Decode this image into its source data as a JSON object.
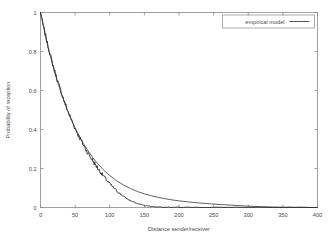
{
  "chart_data": {
    "type": "line",
    "title": "",
    "xlabel": "Distance sender/receiver",
    "ylabel": "Probability of reception",
    "xlim": [
      0,
      400
    ],
    "ylim": [
      0,
      1
    ],
    "grid": false,
    "legend_position": "top-right",
    "xticks": [
      0,
      50,
      100,
      150,
      200,
      250,
      300,
      350,
      400
    ],
    "xtick_labels": [
      "0",
      "50",
      "100",
      "150",
      "200",
      "250",
      "300",
      "350",
      "400"
    ],
    "yticks": [
      0,
      0.2,
      0.4,
      0.6,
      0.8,
      1
    ],
    "ytick_labels": [
      "0",
      "0.2",
      "0.4",
      "0.6",
      "0.8",
      "1"
    ],
    "series": [
      {
        "name": "empirical model",
        "style": "smooth-line",
        "color": "#444444",
        "x": [
          0,
          5,
          10,
          15,
          20,
          25,
          30,
          35,
          40,
          45,
          50,
          55,
          60,
          65,
          70,
          75,
          80,
          85,
          90,
          95,
          100,
          110,
          120,
          130,
          140,
          150,
          160,
          170,
          180,
          190,
          200,
          215,
          230,
          245,
          260,
          275,
          290,
          300,
          320,
          340,
          360,
          380,
          400
        ],
        "values": [
          1.0,
          0.915,
          0.837,
          0.766,
          0.7,
          0.64,
          0.585,
          0.535,
          0.488,
          0.446,
          0.407,
          0.372,
          0.34,
          0.31,
          0.283,
          0.258,
          0.236,
          0.215,
          0.196,
          0.179,
          0.164,
          0.137,
          0.115,
          0.097,
          0.082,
          0.07,
          0.06,
          0.052,
          0.045,
          0.039,
          0.034,
          0.028,
          0.023,
          0.019,
          0.015,
          0.012,
          0.009,
          0.007,
          0.004,
          0.002,
          0.001,
          0.0005,
          0.0
        ]
      },
      {
        "name": "measured data",
        "style": "noisy-line",
        "color": "#2e2e2e",
        "x": [
          0,
          5,
          10,
          15,
          20,
          25,
          30,
          35,
          40,
          45,
          50,
          55,
          60,
          65,
          70,
          75,
          80,
          85,
          90,
          95,
          100,
          105,
          110,
          115,
          120,
          125,
          130,
          135,
          140,
          145,
          150,
          155,
          160,
          165,
          170,
          180,
          190,
          200,
          220,
          240,
          260,
          280,
          300,
          330,
          360,
          400
        ],
        "values": [
          1.0,
          0.918,
          0.84,
          0.77,
          0.705,
          0.645,
          0.59,
          0.538,
          0.49,
          0.447,
          0.405,
          0.368,
          0.334,
          0.3,
          0.27,
          0.243,
          0.216,
          0.19,
          0.166,
          0.143,
          0.122,
          0.103,
          0.086,
          0.07,
          0.057,
          0.045,
          0.035,
          0.027,
          0.02,
          0.015,
          0.011,
          0.008,
          0.006,
          0.004,
          0.003,
          0.002,
          0.0015,
          0.001,
          0.0008,
          0.0005,
          0.0004,
          0.0003,
          0.0002,
          0.0001,
          0.0001,
          0.0
        ]
      }
    ],
    "legend_entries": [
      "empirical model"
    ]
  },
  "legend": {
    "entry_label": "empirical model"
  },
  "axes": {
    "x_title": "Distance sender/receiver",
    "y_title": "Probability of reception"
  }
}
